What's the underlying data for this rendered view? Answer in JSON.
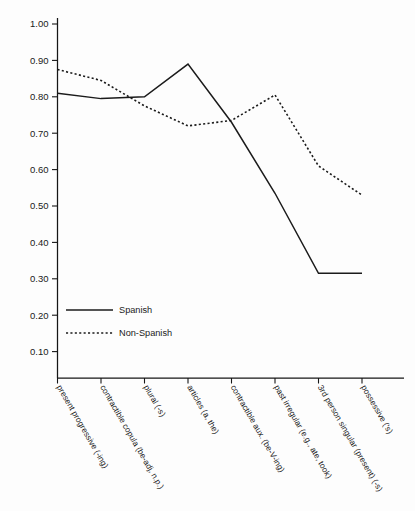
{
  "chart_data": {
    "type": "line",
    "title": "",
    "xlabel": "",
    "ylabel": "",
    "ylim": [
      0.05,
      1.03
    ],
    "grid": false,
    "legend_position": "inside-lower-left",
    "ytick_labels": [
      "1.00",
      "0.90",
      "0.80",
      "0.70",
      "0.60",
      "0.50",
      "0.40",
      "0.30",
      "0.20",
      "0.10"
    ],
    "ytick_values": [
      1.0,
      0.9,
      0.8,
      0.7,
      0.6,
      0.5,
      0.4,
      0.3,
      0.2,
      0.1
    ],
    "categories": [
      "present progressive (-ing)",
      "contractible copula (be-adj, n.p.)",
      "plural (-s)",
      "articles (a, the)",
      "contractible aux. (be-V-ing)",
      "past irregular (e.g., ate, took)",
      "3rd person singular (present) (-s)",
      "possessive ('s)"
    ],
    "series": [
      {
        "name": "Spanish",
        "style": "solid",
        "color": "#1b1b1b",
        "values": [
          0.81,
          0.795,
          0.8,
          0.89,
          0.73,
          0.535,
          0.315,
          0.315
        ]
      },
      {
        "name": "Non-Spanish",
        "style": "dotted",
        "color": "#1b1b1b",
        "values": [
          0.875,
          0.845,
          0.775,
          0.72,
          0.735,
          0.805,
          0.61,
          0.53
        ]
      }
    ]
  },
  "legend": {
    "entries": [
      {
        "label": "Spanish",
        "style": "solid"
      },
      {
        "label": "Non-Spanish",
        "style": "dotted"
      }
    ]
  }
}
